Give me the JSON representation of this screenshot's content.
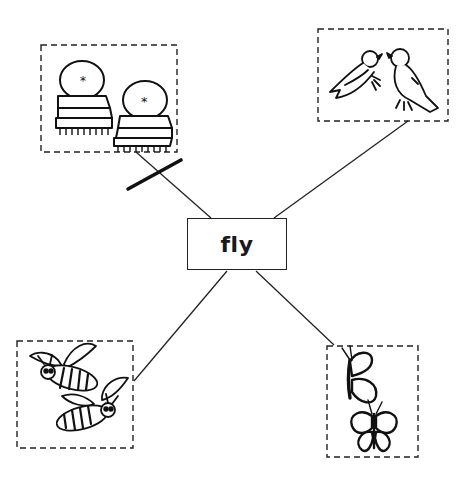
{
  "diagram": {
    "type": "word-picture web",
    "center": {
      "label": "fly"
    },
    "colors": {
      "ink": "#1a1a1a",
      "background": "#ffffff"
    },
    "branches": [
      {
        "position": "top-left",
        "picture": "armchairs",
        "description": "two upholstered armchairs",
        "crossed_out": true
      },
      {
        "position": "top-right",
        "picture": "birds",
        "description": "two birds facing each other",
        "crossed_out": false
      },
      {
        "position": "bottom-left",
        "picture": "bees",
        "description": "two flying bees",
        "crossed_out": false
      },
      {
        "position": "bottom-right",
        "picture": "butterflies",
        "description": "two butterflies",
        "crossed_out": false
      }
    ]
  }
}
